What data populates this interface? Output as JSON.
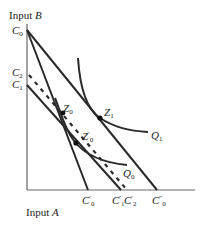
{
  "diagram": {
    "y_axis_label": {
      "text": "Input ",
      "var": "B"
    },
    "x_axis_label": {
      "text": "Input ",
      "var": "A"
    },
    "y_intercepts": [
      {
        "base": "C",
        "sub": "0",
        "y": 30
      },
      {
        "base": "C",
        "sub": "2",
        "y": 73
      },
      {
        "base": "C",
        "sub": "1",
        "y": 85
      }
    ],
    "x_intercepts": [
      {
        "base": "C",
        "prime": "′",
        "sub": "0",
        "x": 88
      },
      {
        "base": "C",
        "prime": "′",
        "sub": "1",
        "x": 121
      },
      {
        "base": "C",
        "prime": "′",
        "sub": "2",
        "x": 127
      },
      {
        "base": "C",
        "prime": "″",
        "sub": "0",
        "x": 157
      }
    ],
    "points": [
      {
        "base": "Z",
        "sub": "0",
        "prime": ""
      },
      {
        "base": "Z",
        "sub": "1",
        "prime": ""
      },
      {
        "base": "Z",
        "sub": "0",
        "prime": "′"
      }
    ],
    "curves": [
      {
        "base": "Q",
        "sub": "1"
      },
      {
        "base": "Q",
        "sub": "0"
      }
    ],
    "colors": {
      "line": "#2a2a2a",
      "axis": "#555555",
      "text": "#222222"
    }
  }
}
